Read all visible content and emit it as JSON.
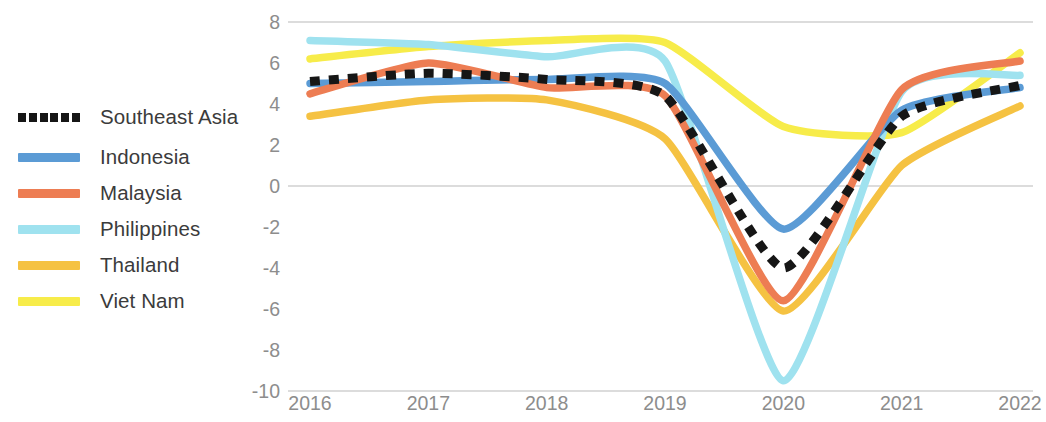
{
  "chart_data": {
    "type": "line",
    "title": "",
    "subtitle": "",
    "xlabel": "",
    "ylabel": "",
    "x": [
      2016,
      2017,
      2018,
      2019,
      2020,
      2021,
      2022
    ],
    "xtick_labels": [
      "2016",
      "2017",
      "2018",
      "2019",
      "2020",
      "2021",
      "2022"
    ],
    "ytick_labels": [
      "8",
      "6",
      "4",
      "2",
      "0",
      "-2",
      "-4",
      "-6",
      "-8",
      "-10"
    ],
    "ytick_values": [
      8,
      6,
      4,
      2,
      0,
      -2,
      -4,
      -6,
      -8,
      -10
    ],
    "ylim": [
      -10,
      8
    ],
    "xlim": [
      2016,
      2022
    ],
    "grid": "horizontal-at-8-0-and-minus-10",
    "legend_position": "left-outside",
    "series": [
      {
        "name": "Southeast Asia",
        "color": "#161616",
        "style": "dotted",
        "values": [
          5.1,
          5.5,
          5.2,
          4.4,
          -4.0,
          3.4,
          4.9
        ]
      },
      {
        "name": "Indonesia",
        "color": "#5B9BD5",
        "style": "solid",
        "values": [
          5.0,
          5.1,
          5.2,
          5.0,
          -2.1,
          3.7,
          4.8
        ]
      },
      {
        "name": "Malaysia",
        "color": "#ED7D53",
        "style": "solid",
        "values": [
          4.5,
          6.0,
          4.8,
          4.4,
          -5.6,
          4.7,
          6.1
        ]
      },
      {
        "name": "Philippines",
        "color": "#9FE2EF",
        "style": "solid",
        "values": [
          7.1,
          6.9,
          6.3,
          6.1,
          -9.5,
          4.6,
          5.4
        ]
      },
      {
        "name": "Thailand",
        "color": "#F5C242",
        "style": "solid",
        "values": [
          3.4,
          4.2,
          4.2,
          2.3,
          -6.1,
          1.0,
          3.9
        ]
      },
      {
        "name": "Viet Nam",
        "color": "#F7EC4A",
        "style": "solid",
        "values": [
          6.2,
          6.8,
          7.1,
          7.0,
          2.9,
          2.6,
          6.5
        ]
      }
    ]
  },
  "legend": {
    "items": [
      {
        "label": "Southeast Asia",
        "color": "#161616",
        "style": "dotted"
      },
      {
        "label": "Indonesia",
        "color": "#5B9BD5",
        "style": "solid"
      },
      {
        "label": "Malaysia",
        "color": "#ED7D53",
        "style": "solid"
      },
      {
        "label": "Philippines",
        "color": "#9FE2EF",
        "style": "solid"
      },
      {
        "label": "Thailand",
        "color": "#F5C242",
        "style": "solid"
      },
      {
        "label": "Viet Nam",
        "color": "#F7EC4A",
        "style": "solid"
      }
    ]
  }
}
